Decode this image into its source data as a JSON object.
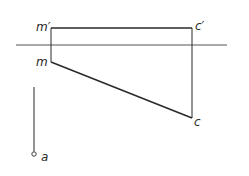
{
  "diagram": {
    "type": "orthographic-projection",
    "labels": {
      "m_prime": "m′",
      "c_prime": "c′",
      "m": "m",
      "c": "c",
      "a": "a"
    },
    "colors": {
      "line": "#2a2a2a",
      "ground_line": "#555555",
      "background": "#ffffff"
    },
    "points": {
      "m_prime": [
        51,
        28
      ],
      "c_prime": [
        192,
        28
      ],
      "m": [
        51,
        62
      ],
      "c": [
        192,
        118
      ],
      "a": [
        34,
        154
      ]
    },
    "ground_line": {
      "x1": 16,
      "x2": 227,
      "y": 45
    },
    "vertical_a_line": {
      "x": 34,
      "y1": 87,
      "y2": 152
    }
  }
}
